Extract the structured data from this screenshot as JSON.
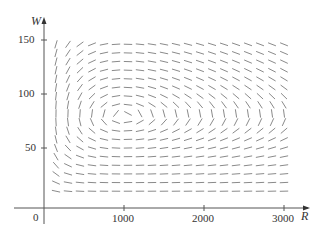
{
  "chart_data": {
    "type": "direction-field",
    "title": "",
    "xlabel": "R",
    "ylabel": "W",
    "origin_label": "0",
    "x_ticks": [
      1000,
      2000,
      3000
    ],
    "y_ticks": [
      50,
      100,
      150
    ],
    "xlim": [
      0,
      3200
    ],
    "ylim": [
      0,
      160
    ],
    "grid": false,
    "system": {
      "dR_dt": "0.08R - 0.001RW",
      "dW_dt": "-0.02W + 0.00002RW",
      "equilibrium": {
        "R": 1000,
        "W": 80
      }
    },
    "field_R_values": [
      150,
      300,
      450,
      600,
      750,
      900,
      1050,
      1200,
      1350,
      1500,
      1650,
      1800,
      1950,
      2100,
      2250,
      2400,
      2550,
      2700,
      2850,
      3000
    ],
    "field_W_values": [
      10,
      18,
      26,
      34,
      42,
      50,
      58,
      66,
      74,
      82,
      90,
      98,
      106,
      114,
      122,
      130,
      138,
      146
    ],
    "segment_color": "#8a8a8a",
    "axis_color": "#555555"
  },
  "labels": {
    "x_axis": "R",
    "y_axis": "W",
    "origin": "0",
    "x_tick_1000": "1000",
    "x_tick_2000": "2000",
    "x_tick_3000": "3000",
    "y_tick_50": "50",
    "y_tick_100": "100",
    "y_tick_150": "150"
  }
}
